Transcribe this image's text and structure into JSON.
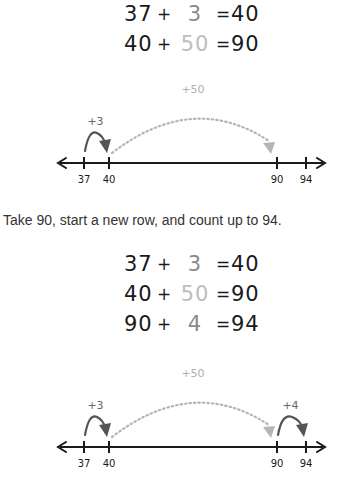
{
  "block1": {
    "equations": [
      {
        "a": "37",
        "op": "+",
        "b": "3",
        "eq": "=",
        "r": "40"
      },
      {
        "a": "40",
        "op": "+",
        "b": "50",
        "eq": "=",
        "r": "90"
      }
    ],
    "numberline": {
      "ticks": [
        {
          "value": 37,
          "label": "37"
        },
        {
          "value": 40,
          "label": "40"
        },
        {
          "value": 90,
          "label": "90"
        },
        {
          "value": 94,
          "label": "94"
        }
      ],
      "jumps": [
        {
          "from": 37,
          "to": 40,
          "label": "+3",
          "style": "solid"
        },
        {
          "from": 40,
          "to": 90,
          "label": "+50",
          "style": "dotted"
        }
      ]
    }
  },
  "instruction": "Take 90, start a new row, and count up to 94.",
  "block2": {
    "equations": [
      {
        "a": "37",
        "op": "+",
        "b": "3",
        "eq": "=",
        "r": "40"
      },
      {
        "a": "40",
        "op": "+",
        "b": "50",
        "eq": "=",
        "r": "90"
      },
      {
        "a": "90",
        "op": "+",
        "b": "4",
        "eq": "=",
        "r": "94"
      }
    ],
    "numberline": {
      "ticks": [
        {
          "value": 37,
          "label": "37"
        },
        {
          "value": 40,
          "label": "40"
        },
        {
          "value": 90,
          "label": "90"
        },
        {
          "value": 94,
          "label": "94"
        }
      ],
      "jumps": [
        {
          "from": 37,
          "to": 40,
          "label": "+3",
          "style": "solid"
        },
        {
          "from": 40,
          "to": 90,
          "label": "+50",
          "style": "dotted"
        },
        {
          "from": 90,
          "to": 94,
          "label": "+4",
          "style": "solid"
        }
      ]
    }
  },
  "colors": {
    "ink": "#1a1a1a",
    "solid_jump": "#555555",
    "dotted_jump": "#b5b5b5",
    "label_dark": "#666666",
    "label_light": "#b0b0b0"
  }
}
